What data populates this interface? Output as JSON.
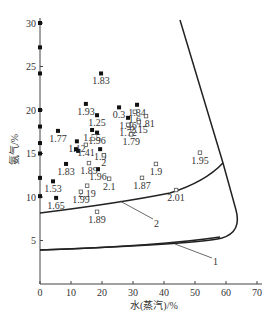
{
  "chart_data": {
    "type": "scatter",
    "title": "",
    "xlabel": "水(蒸汽)/%",
    "ylabel": "氨气/%",
    "xlim": [
      0,
      70
    ],
    "ylim": [
      0,
      30
    ],
    "xticks": [
      0,
      10,
      20,
      30,
      40,
      50,
      60,
      70
    ],
    "yticks": [
      5,
      10,
      15,
      20,
      25,
      30
    ],
    "grid": false,
    "legend": null,
    "series": [
      {
        "name": "filled",
        "marker": "filled-square",
        "points": [
          {
            "x": 0,
            "y": 30,
            "label": ""
          },
          {
            "x": 0,
            "y": 27.2,
            "label": ""
          },
          {
            "x": 0,
            "y": 24.2,
            "label": ""
          },
          {
            "x": 0,
            "y": 20,
            "label": ""
          },
          {
            "x": 0,
            "y": 18.1,
            "label": ""
          },
          {
            "x": 0,
            "y": 16.2,
            "label": ""
          },
          {
            "x": 0,
            "y": 15,
            "label": ""
          },
          {
            "x": 0,
            "y": 12.2,
            "label": ""
          },
          {
            "x": 0,
            "y": 10.1,
            "label": ""
          },
          {
            "x": 19.7,
            "y": 24.2,
            "label": "1.83"
          },
          {
            "x": 14.8,
            "y": 20.7,
            "label": "1.93"
          },
          {
            "x": 18.4,
            "y": 19.4,
            "label": "1.25"
          },
          {
            "x": 25.5,
            "y": 20.3,
            "label": "0.3"
          },
          {
            "x": 31.3,
            "y": 20.6,
            "label": "1.84"
          },
          {
            "x": 28.4,
            "y": 19.1,
            "label": "1.46"
          },
          {
            "x": 5.8,
            "y": 17.6,
            "label": "1.77"
          },
          {
            "x": 16.8,
            "y": 17.7,
            "label": "1.55"
          },
          {
            "x": 18.4,
            "y": 17.4,
            "label": "1.96"
          },
          {
            "x": 11.9,
            "y": 16.4,
            "label": "1.12"
          },
          {
            "x": 11.6,
            "y": 15.5,
            "label": ""
          },
          {
            "x": 12.3,
            "y": 15.3,
            "label": ""
          },
          {
            "x": 19.4,
            "y": 15.5,
            "label": "1.9"
          },
          {
            "x": 8.4,
            "y": 13.8,
            "label": "1.83"
          },
          {
            "x": 18.7,
            "y": 13.2,
            "label": "1.96"
          },
          {
            "x": 4.2,
            "y": 11.8,
            "label": "1.53"
          },
          {
            "x": 5.2,
            "y": 9.9,
            "label": "1.65"
          }
        ]
      },
      {
        "name": "open",
        "marker": "open-square",
        "points": [
          {
            "x": 30.6,
            "y": 19.8,
            "label": "1.6"
          },
          {
            "x": 34.2,
            "y": 19.3,
            "label": "1.81"
          },
          {
            "x": 31.9,
            "y": 18.6,
            "label": "2.15"
          },
          {
            "x": 28.4,
            "y": 18.3,
            "label": "1.72"
          },
          {
            "x": 29.4,
            "y": 17.2,
            "label": "1.79"
          },
          {
            "x": 14.8,
            "y": 16.0,
            "label": "1.41"
          },
          {
            "x": 20.6,
            "y": 14.8,
            "label": "2"
          },
          {
            "x": 15.8,
            "y": 13.9,
            "label": "1.89"
          },
          {
            "x": 22.3,
            "y": 12.1,
            "label": "2.1"
          },
          {
            "x": 32.9,
            "y": 12.2,
            "label": "1.87"
          },
          {
            "x": 37.4,
            "y": 13.8,
            "label": "1.9"
          },
          {
            "x": 51.6,
            "y": 15.1,
            "label": "1.95"
          },
          {
            "x": 43.9,
            "y": 10.8,
            "label": "2.01"
          },
          {
            "x": 15.2,
            "y": 11.3,
            "label": "2.19"
          },
          {
            "x": 13.2,
            "y": 10.6,
            "label": "1.99"
          },
          {
            "x": 18.4,
            "y": 8.3,
            "label": "1.89"
          }
        ]
      }
    ],
    "curves": [
      {
        "name": "1",
        "label": "1",
        "description": "lower flammability boundary"
      },
      {
        "name": "2",
        "label": "2",
        "description": "inner boundary"
      }
    ],
    "annotations": [
      "1",
      "2"
    ]
  },
  "axes": {
    "x_title": "水(蒸汽)/%",
    "y_title": "氨气/%",
    "x_tick_labels": [
      "0",
      "10",
      "20",
      "30",
      "40",
      "50",
      "60",
      "70"
    ],
    "y_tick_labels": [
      "5",
      "10",
      "15",
      "20",
      "25",
      "30"
    ]
  },
  "curve_labels": {
    "c1": "1",
    "c2": "2"
  }
}
